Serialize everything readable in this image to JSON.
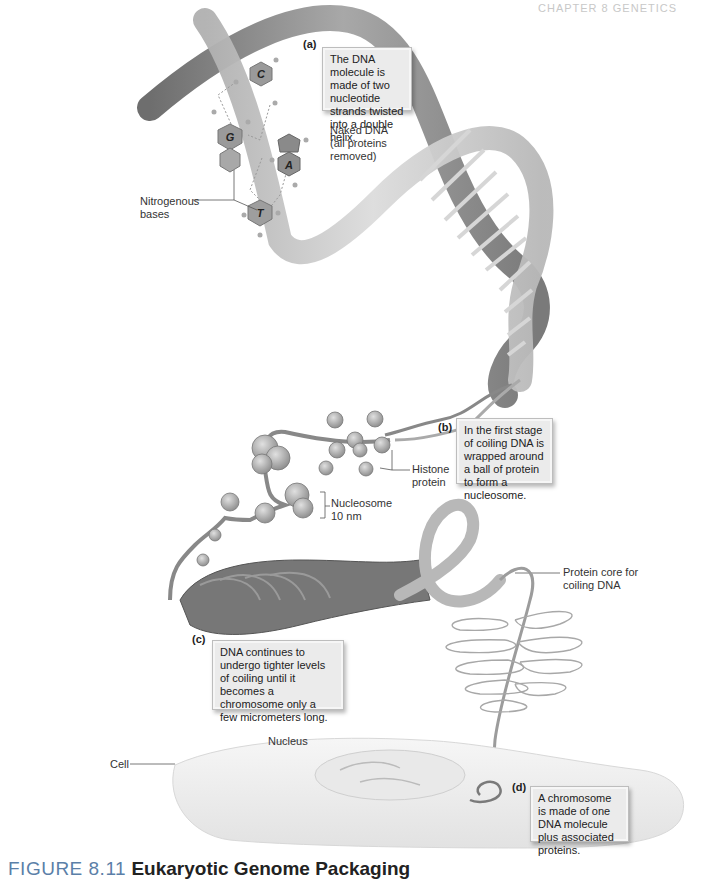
{
  "header": {
    "running_head": "CHAPTER 8 GENETICS"
  },
  "callouts": {
    "a": {
      "tag": "(a)",
      "text": "The DNA molecule is made of two nucleotide strands twisted into a double helix."
    },
    "b": {
      "tag": "(b)",
      "text": "In the first stage of coiling DNA is wrapped around a ball of protein to form a nucleosome."
    },
    "c": {
      "tag": "(c)",
      "text": "DNA continues to undergo tighter levels of coiling until it becomes a chromosome only a few micrometers long."
    },
    "d": {
      "tag": "(d)",
      "text": "A chromosome is made of one DNA molecule plus associated proteins."
    }
  },
  "labels": {
    "naked_dna": "Naked DNA\n(all proteins\nremoved)",
    "nitrogenous_bases": "Nitrogenous\nbases",
    "histone_protein": "Histone\nprotein",
    "nucleosome": "Nucleosome\n10 nm",
    "protein_core": "Protein core for\ncoiling DNA",
    "nucleus": "Nucleus",
    "cell": "Cell"
  },
  "bases": [
    "C",
    "G",
    "A",
    "T"
  ],
  "caption": {
    "figure_number": "FIGURE 8.11",
    "title": "Eukaryotic Genome Packaging"
  },
  "colors": {
    "ribbon": "#8c8c8c",
    "ribbon_light": "#c4c4c4",
    "base_fill": "#9a9a9a",
    "callout_bg": "#ebebeb",
    "figure_blue": "#5b7fa8"
  }
}
